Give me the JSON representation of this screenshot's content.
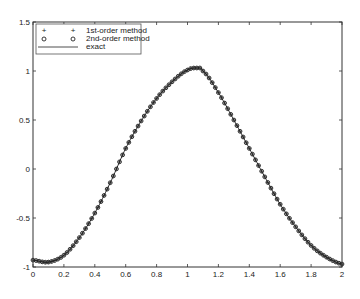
{
  "chart_data": {
    "type": "line",
    "title": "",
    "xlabel": "",
    "ylabel": "",
    "xlim": [
      0,
      2
    ],
    "ylim": [
      -1,
      1.5
    ],
    "grid": false,
    "legend_position": "upper-left",
    "x_ticks": [
      "0",
      "0.2",
      "0.4",
      "0.6",
      "0.8",
      "1",
      "1.2",
      "1.4",
      "1.6",
      "1.8",
      "2"
    ],
    "y_ticks": [
      "-1",
      "-0.5",
      "0",
      "0.5",
      "1",
      "1.5"
    ],
    "legend": [
      {
        "marker": "+",
        "label": "1st-order method"
      },
      {
        "marker": "o",
        "label": "2nd-order method"
      },
      {
        "marker": "line",
        "label": "exact"
      }
    ],
    "x": [
      0,
      0.1,
      0.2,
      0.3,
      0.4,
      0.5,
      0.6,
      0.7,
      0.8,
      0.9,
      1.0,
      1.07,
      1.1,
      1.2,
      1.3,
      1.4,
      1.5,
      1.6,
      1.7,
      1.8,
      1.9,
      2.0
    ],
    "series": [
      {
        "name": "1st-order method",
        "marker": "+",
        "values": [
          -0.93,
          -0.95,
          -0.88,
          -0.7,
          -0.45,
          -0.14,
          0.21,
          0.49,
          0.72,
          0.89,
          1.01,
          1.03,
          1.0,
          0.78,
          0.5,
          0.21,
          -0.08,
          -0.36,
          -0.59,
          -0.78,
          -0.9,
          -0.97
        ]
      },
      {
        "name": "2nd-order method",
        "marker": "o",
        "values": [
          -0.93,
          -0.95,
          -0.88,
          -0.7,
          -0.45,
          -0.14,
          0.21,
          0.49,
          0.72,
          0.89,
          1.01,
          1.03,
          1.0,
          0.78,
          0.5,
          0.21,
          -0.08,
          -0.36,
          -0.59,
          -0.78,
          -0.9,
          -0.97
        ]
      },
      {
        "name": "exact",
        "marker": "line",
        "values": [
          -0.93,
          -0.95,
          -0.88,
          -0.7,
          -0.45,
          -0.14,
          0.21,
          0.49,
          0.72,
          0.89,
          1.01,
          1.03,
          1.0,
          0.78,
          0.5,
          0.21,
          -0.08,
          -0.36,
          -0.59,
          -0.78,
          -0.9,
          -0.97
        ]
      }
    ]
  },
  "style": {
    "axis_color": "#333333",
    "curve_color": "#222222",
    "background": "#ffffff"
  }
}
